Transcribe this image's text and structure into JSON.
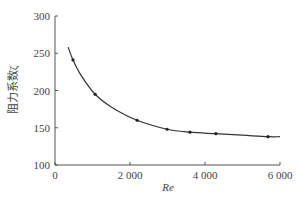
{
  "chart_data": {
    "type": "line",
    "title": "",
    "xlabel": "Re",
    "ylabel": "阻力系数ζ",
    "xlim": [
      0,
      6000
    ],
    "ylim": [
      100,
      300
    ],
    "grid": false,
    "legend": null,
    "x_ticks": [
      0,
      2000,
      4000,
      6000
    ],
    "x_tick_labels": [
      "0",
      "2 000",
      "4 000",
      "6 000"
    ],
    "y_ticks": [
      100,
      150,
      200,
      250,
      300
    ],
    "y_tick_labels": [
      "100",
      "150",
      "200",
      "250",
      "300"
    ],
    "series": [
      {
        "name": "measured",
        "marker": "dot",
        "x": [
          480,
          1070,
          2190,
          2990,
          3600,
          4290,
          5680
        ],
        "y": [
          241,
          195,
          160,
          148,
          144,
          142,
          138
        ]
      },
      {
        "name": "fit-curve",
        "marker": "none",
        "x": [
          350,
          480,
          700,
          1070,
          1500,
          2190,
          2990,
          3600,
          4290,
          5000,
          5680,
          6000
        ],
        "y": [
          258,
          241,
          220,
          195,
          178,
          160,
          148,
          144,
          142,
          140,
          138,
          138
        ]
      }
    ]
  }
}
